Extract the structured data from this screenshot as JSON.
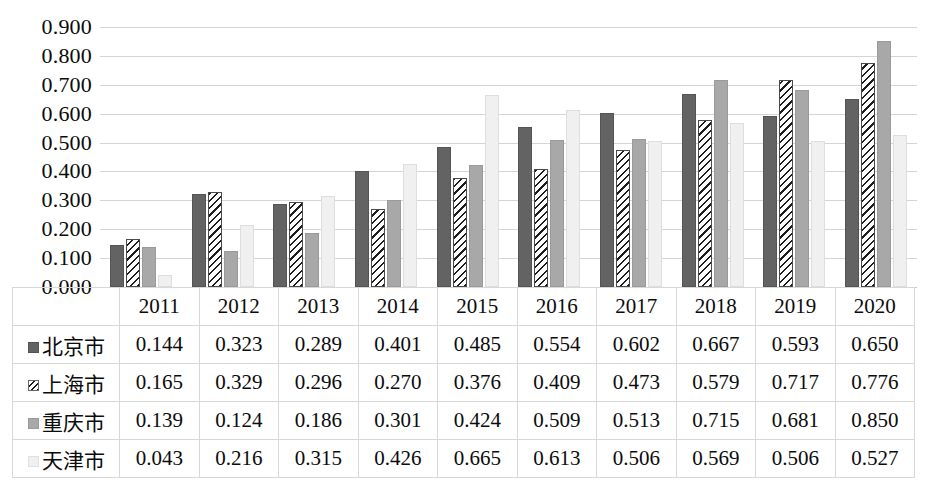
{
  "chart_data": {
    "type": "bar",
    "title": "",
    "subtitle": "",
    "xlabel": "",
    "ylabel": "",
    "grid": true,
    "legend_position": "data-table-left",
    "ylim": [
      0.0,
      0.9
    ],
    "yticks": [
      "0.000",
      "0.100",
      "0.200",
      "0.300",
      "0.400",
      "0.500",
      "0.600",
      "0.700",
      "0.800",
      "0.900"
    ],
    "ytick_values": [
      0.0,
      0.1,
      0.2,
      0.3,
      0.4,
      0.5,
      0.6,
      0.7,
      0.8,
      0.9
    ],
    "categories": [
      "2011",
      "2012",
      "2013",
      "2014",
      "2015",
      "2016",
      "2017",
      "2018",
      "2019",
      "2020"
    ],
    "series": [
      {
        "name": "北京市",
        "marker": "dark-gray-solid-square",
        "color": "#636363",
        "values": [
          0.144,
          0.323,
          0.289,
          0.401,
          0.485,
          0.554,
          0.602,
          0.667,
          0.593,
          0.65
        ],
        "labels": [
          "0.144",
          "0.323",
          "0.289",
          "0.401",
          "0.485",
          "0.554",
          "0.602",
          "0.667",
          "0.593",
          "0.650"
        ]
      },
      {
        "name": "上海市",
        "marker": "diagonal-hatch-square",
        "color": "#ffffff",
        "values": [
          0.165,
          0.329,
          0.296,
          0.27,
          0.376,
          0.409,
          0.473,
          0.579,
          0.717,
          0.776
        ],
        "labels": [
          "0.165",
          "0.329",
          "0.296",
          "0.270",
          "0.376",
          "0.409",
          "0.473",
          "0.579",
          "0.717",
          "0.776"
        ]
      },
      {
        "name": "重庆市",
        "marker": "medium-gray-solid-square",
        "color": "#a8a8a8",
        "values": [
          0.139,
          0.124,
          0.186,
          0.301,
          0.424,
          0.509,
          0.513,
          0.715,
          0.681,
          0.85
        ],
        "labels": [
          "0.139",
          "0.124",
          "0.186",
          "0.301",
          "0.424",
          "0.509",
          "0.513",
          "0.715",
          "0.681",
          "0.850"
        ]
      },
      {
        "name": "天津市",
        "marker": "light-gray-solid-square",
        "color": "#f0f0f0",
        "values": [
          0.043,
          0.216,
          0.315,
          0.426,
          0.665,
          0.613,
          0.506,
          0.569,
          0.506,
          0.527
        ],
        "labels": [
          "0.043",
          "0.216",
          "0.315",
          "0.426",
          "0.665",
          "0.613",
          "0.506",
          "0.569",
          "0.506",
          "0.527"
        ]
      }
    ]
  }
}
